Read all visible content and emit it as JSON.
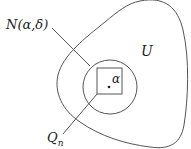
{
  "diagram": {
    "labels": {
      "neighborhood": "N(α,δ)",
      "set": "U",
      "point": "α",
      "cube_base": "Q",
      "cube_sub": "n"
    },
    "elements": [
      {
        "name": "open-set-U",
        "shape": "closed-curve"
      },
      {
        "name": "neighborhood-N",
        "shape": "circle"
      },
      {
        "name": "cube-Qn",
        "shape": "square"
      },
      {
        "name": "point-alpha",
        "shape": "dot"
      }
    ],
    "colors": {
      "stroke": "#555555",
      "text": "#222222",
      "background": "#ffffff"
    }
  }
}
